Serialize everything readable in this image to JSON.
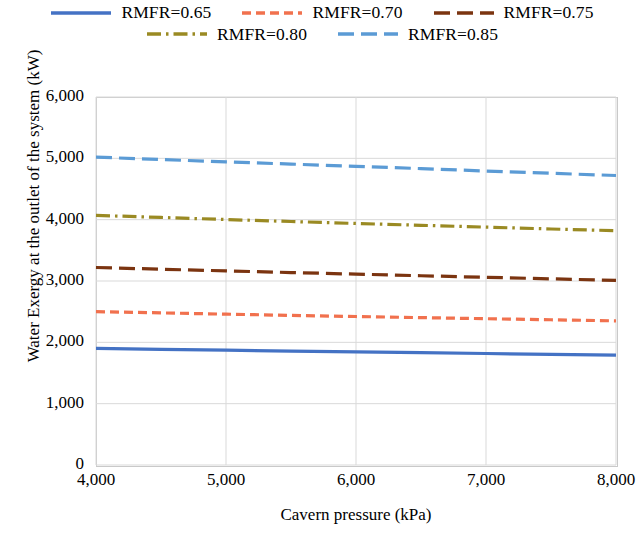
{
  "chart_data": {
    "type": "line",
    "title": "",
    "xlabel": "Cavern pressure (kPa)",
    "ylabel": "Water Exergy at the outlet of the system (kW)",
    "xlim": [
      4000,
      8000
    ],
    "ylim": [
      0,
      6000
    ],
    "xticks": [
      "4,000",
      "5,000",
      "6,000",
      "7,000",
      "8,000"
    ],
    "xtick_values": [
      4000,
      5000,
      6000,
      7000,
      8000
    ],
    "yticks": [
      "0",
      "1,000",
      "2,000",
      "3,000",
      "4,000",
      "5,000",
      "6,000"
    ],
    "ytick_values": [
      0,
      1000,
      2000,
      3000,
      4000,
      5000,
      6000
    ],
    "grid": true,
    "legend_position": "top",
    "x": [
      4000,
      4500,
      5000,
      5500,
      6000,
      6500,
      7000,
      7500,
      8000
    ],
    "series": [
      {
        "name": "RMFR=0.65",
        "color": "#4472C4",
        "dash": "solid",
        "values": [
          1900,
          1885,
          1872,
          1858,
          1845,
          1832,
          1818,
          1804,
          1790
        ]
      },
      {
        "name": "RMFR=0.70",
        "color": "#F1714E",
        "dash": "dashed",
        "values": [
          2500,
          2480,
          2459,
          2440,
          2421,
          2403,
          2385,
          2368,
          2350
        ]
      },
      {
        "name": "RMFR=0.75",
        "color": "#7B3410",
        "dash": "long-dashed",
        "values": [
          3220,
          3192,
          3165,
          3138,
          3112,
          3086,
          3060,
          3035,
          3010
        ]
      },
      {
        "name": "RMFR=0.80",
        "color": "#9A8A23",
        "dash": "dash-dot",
        "values": [
          4070,
          4036,
          4002,
          3970,
          3938,
          3908,
          3878,
          3848,
          3820
        ]
      },
      {
        "name": "RMFR=0.85",
        "color": "#5B9BD5",
        "dash": "long-dashed",
        "values": [
          5020,
          4980,
          4942,
          4906,
          4870,
          4832,
          4793,
          4756,
          4720
        ]
      }
    ]
  },
  "legend": {
    "rows": [
      [
        {
          "label": "RMFR=0.65",
          "color": "#4472C4",
          "dash": "solid"
        },
        {
          "label": "RMFR=0.70",
          "color": "#F1714E",
          "dash": "dashed"
        },
        {
          "label": "RMFR=0.75",
          "color": "#7B3410",
          "dash": "long-dashed"
        }
      ],
      [
        {
          "label": "RMFR=0.80",
          "color": "#9A8A23",
          "dash": "dash-dot"
        },
        {
          "label": "RMFR=0.85",
          "color": "#5B9BD5",
          "dash": "long-dashed"
        }
      ]
    ]
  },
  "style": {
    "grid_color": "#D9D9D9",
    "axis_color": "#BFBFBF",
    "background": "#FFFFFF"
  }
}
